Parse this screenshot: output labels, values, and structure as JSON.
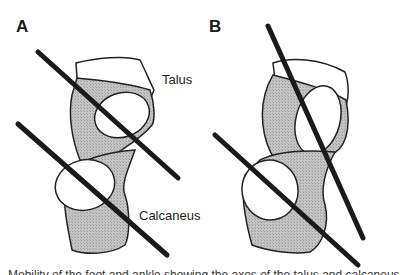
{
  "figure": {
    "panels": [
      {
        "id": "A",
        "label": "A"
      },
      {
        "id": "B",
        "label": "B"
      }
    ],
    "labels": {
      "talus": "Talus",
      "calcaneus": "Calcaneus"
    },
    "caption_partial": "Mobility of the foot and ankle showing the axes of the talus and calcaneus",
    "colors": {
      "bone_fill": "#bdbdbd",
      "bone_outline": "#222222",
      "axis_line": "#1a1a1a",
      "background": "#ffffff"
    }
  }
}
